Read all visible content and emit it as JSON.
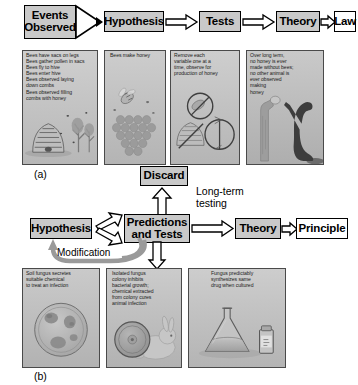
{
  "figure": {
    "panel_a_label": "(a)",
    "panel_b_label": "(b)"
  },
  "flow_a": {
    "nodes": [
      {
        "id": "events-observed",
        "label": "Events\nObserved",
        "fill": "gray"
      },
      {
        "id": "hypothesis",
        "label": "Hypothesis",
        "fill": "gray"
      },
      {
        "id": "tests",
        "label": "Tests",
        "fill": "gray"
      },
      {
        "id": "theory",
        "label": "Theory",
        "fill": "gray"
      },
      {
        "id": "law",
        "label": "Law",
        "fill": "white"
      }
    ],
    "node_labels": {
      "events_observed_line1": "Events",
      "events_observed_line2": "Observed",
      "hypothesis": "Hypothesis",
      "tests": "Tests",
      "theory": "Theory",
      "law": "Law"
    },
    "panels": [
      {
        "id": "bee-observations",
        "caption": "Bees have sacs on legs\nBees gather pollen in sacs\nBees fly to hive\nBees enter hive\nBees observed laying\ndown combs\nBees observed filling\ncombs with honey",
        "art": "beehive-and-trees-illustration"
      },
      {
        "id": "bees-make-honey",
        "caption": "Bees make honey",
        "art": "bee-on-honeycomb-illustration"
      },
      {
        "id": "remove-variables",
        "caption": "Remove each\nvariable one at a\ntime, observe for\nproduction of honey",
        "art": "crossed-out-hive-and-bee-illustration"
      },
      {
        "id": "long-term-observation",
        "caption": "Over long term,\nno honey is ever\nmade without bees;\nno other animal is\never observed\nmaking\nhoney",
        "art": "bear-reaching-tree-hive-illustration"
      }
    ]
  },
  "flow_b": {
    "node_labels": {
      "discard": "Discard",
      "hypothesis": "Hypothesis",
      "predictions_line1": "Predictions",
      "predictions_line2": "and Tests",
      "theory": "Theory",
      "principle": "Principle"
    },
    "annotations": {
      "long_term_testing_line1": "Long-term",
      "long_term_testing_line2": "testing",
      "modification": "Modification"
    },
    "panels": [
      {
        "id": "soil-fungus",
        "caption": "Soil fungus secretes\nsuitable chemical\nto treat an infection",
        "art": "petri-dish-fungus-colonies-illustration"
      },
      {
        "id": "isolated-colony",
        "caption": "Isolated fungus\ncolony inhibits\nbacterial growth;\nchemical extracted\nfrom colony cures\nanimal infection",
        "art": "petri-dish-and-rabbit-illustration"
      },
      {
        "id": "cultured-synthesis",
        "caption": "Fungus predictably\nsynthesizes same\ndrug when cultured",
        "art": "flask-and-drug-vial-illustration"
      }
    ]
  },
  "colors": {
    "box_fill_gray": "#c9c9c9",
    "box_fill_white": "#ffffff",
    "panel_fill": "#c4c4c4",
    "outline": "#000000"
  }
}
